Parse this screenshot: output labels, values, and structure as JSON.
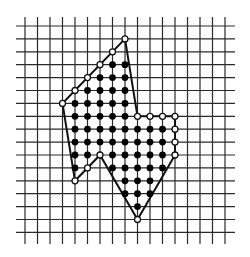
{
  "figure": {
    "grid": {
      "origin_x": 25,
      "origin_y": 26,
      "spacing_x": 12.5,
      "spacing_y": 12.9,
      "columns": 17,
      "rows": 17,
      "h_line_x_start": 16,
      "h_line_x_end": 235,
      "v_line_y_start": 17,
      "v_line_y_end": 244
    },
    "polygon_vertices": [
      [
        8,
        1
      ],
      [
        9,
        7
      ],
      [
        12,
        7
      ],
      [
        12,
        10
      ],
      [
        9,
        15
      ],
      [
        6,
        10
      ],
      [
        4,
        12
      ],
      [
        3,
        6
      ]
    ],
    "boundary_points": [
      [
        8,
        1
      ],
      [
        7,
        2
      ],
      [
        6,
        3
      ],
      [
        5,
        4
      ],
      [
        4,
        5
      ],
      [
        3,
        6
      ],
      [
        4,
        12
      ],
      [
        5,
        11
      ],
      [
        6,
        10
      ],
      [
        9,
        15
      ],
      [
        12,
        10
      ],
      [
        12,
        9
      ],
      [
        12,
        8
      ],
      [
        12,
        7
      ],
      [
        11,
        7
      ],
      [
        10,
        7
      ],
      [
        9,
        7
      ]
    ],
    "interior_points": [
      [
        7,
        3
      ],
      [
        8,
        3
      ],
      [
        6,
        4
      ],
      [
        7,
        4
      ],
      [
        8,
        4
      ],
      [
        5,
        5
      ],
      [
        6,
        5
      ],
      [
        7,
        5
      ],
      [
        8,
        5
      ],
      [
        4,
        6
      ],
      [
        5,
        6
      ],
      [
        6,
        6
      ],
      [
        7,
        6
      ],
      [
        8,
        6
      ],
      [
        4,
        7
      ],
      [
        5,
        7
      ],
      [
        6,
        7
      ],
      [
        7,
        7
      ],
      [
        8,
        7
      ],
      [
        4,
        8
      ],
      [
        5,
        8
      ],
      [
        6,
        8
      ],
      [
        7,
        8
      ],
      [
        8,
        8
      ],
      [
        9,
        8
      ],
      [
        10,
        8
      ],
      [
        11,
        8
      ],
      [
        4,
        9
      ],
      [
        5,
        9
      ],
      [
        6,
        9
      ],
      [
        7,
        9
      ],
      [
        8,
        9
      ],
      [
        9,
        9
      ],
      [
        10,
        9
      ],
      [
        11,
        9
      ],
      [
        4,
        10
      ],
      [
        5,
        10
      ],
      [
        7,
        10
      ],
      [
        8,
        10
      ],
      [
        9,
        10
      ],
      [
        10,
        10
      ],
      [
        11,
        10
      ],
      [
        4,
        11
      ],
      [
        7,
        11
      ],
      [
        8,
        11
      ],
      [
        9,
        11
      ],
      [
        10,
        11
      ],
      [
        11,
        11
      ],
      [
        8,
        12
      ],
      [
        9,
        12
      ],
      [
        10,
        12
      ],
      [
        8,
        13
      ],
      [
        9,
        13
      ],
      [
        10,
        13
      ],
      [
        9,
        14
      ]
    ],
    "colors": {
      "grid": "#2a2a2a",
      "outline": "#111111",
      "filled_dot": "#000000",
      "open_dot_fill": "#ffffff"
    }
  }
}
